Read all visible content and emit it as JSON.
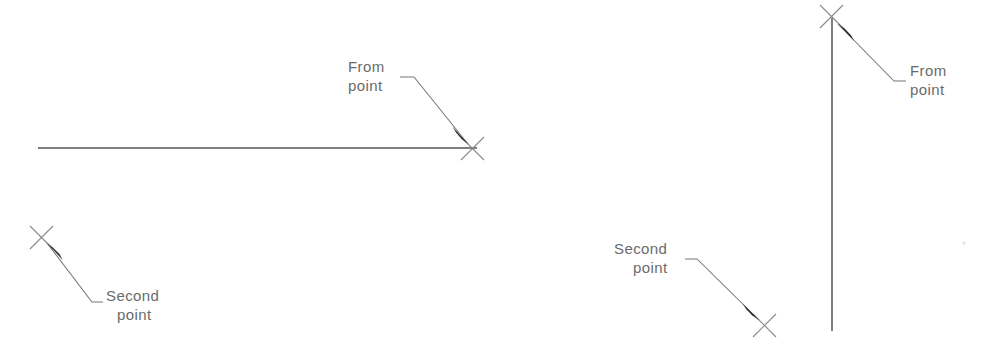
{
  "figure": {
    "title": "",
    "background_color": "#ffffff",
    "width": 984,
    "height": 349,
    "line_color": "#555555",
    "leader_color": "#777777",
    "marker_color": "#8a8a8a",
    "arrow_color": "#2b2b2b",
    "text_color": "#6b6b6b"
  },
  "diagrams": [
    {
      "name": "horizontal-line-example",
      "geometry_type": "horizontal-line",
      "line": {
        "x1": 38,
        "y1": 148,
        "x2": 477,
        "y2": 148
      },
      "markers": [
        {
          "role": "from-point",
          "x": 472,
          "y": 148,
          "glyph": "x-cross"
        },
        {
          "role": "second-point",
          "x": 41,
          "y": 237,
          "glyph": "x-cross"
        }
      ],
      "annotations": [
        {
          "role": "from-point",
          "line1": "From",
          "line2": "point",
          "text_x": 348,
          "text_line1_y": 72,
          "text_line2_y": 91,
          "leader": {
            "shelf_x1": 400,
            "shelf_x2": 414,
            "shelf_y": 77,
            "tip_x": 468,
            "tip_y": 144
          },
          "arrow_direction": "down-right"
        },
        {
          "role": "second-point",
          "line1": "Second",
          "line2": "point",
          "text_x": 106,
          "text_line1_y": 301,
          "text_line2_y": 320,
          "leader": {
            "shelf_x1": 103,
            "shelf_x2": 92,
            "shelf_y": 302,
            "tip_x": 47,
            "tip_y": 243
          },
          "arrow_direction": "up-left"
        }
      ]
    },
    {
      "name": "vertical-line-example",
      "geometry_type": "vertical-line",
      "line": {
        "x1": 832,
        "y1": 18,
        "x2": 832,
        "y2": 331
      },
      "markers": [
        {
          "role": "from-point",
          "x": 831,
          "y": 16,
          "glyph": "x-cross"
        },
        {
          "role": "second-point",
          "x": 764,
          "y": 325,
          "glyph": "x-cross"
        }
      ],
      "annotations": [
        {
          "role": "from-point",
          "line1": "From",
          "line2": "point",
          "text_x": 910,
          "text_line1_y": 76,
          "text_line2_y": 95,
          "leader": {
            "shelf_x1": 906,
            "shelf_x2": 894,
            "shelf_y": 81,
            "tip_x": 838,
            "tip_y": 24
          },
          "arrow_direction": "up-left"
        },
        {
          "role": "second-point",
          "line1": "Second",
          "line2": "point",
          "text_x": 614,
          "text_line1_y": 254,
          "text_line2_y": 273,
          "leader": {
            "shelf_x1": 685,
            "shelf_x2": 697,
            "shelf_y": 259,
            "tip_x": 759,
            "tip_y": 320
          },
          "arrow_direction": "down-right"
        }
      ]
    }
  ],
  "artifact": {
    "x": 964,
    "y": 243,
    "r": 1.6
  }
}
